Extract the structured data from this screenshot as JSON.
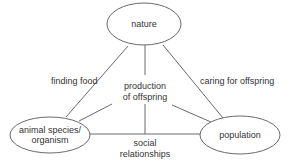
{
  "diagram": {
    "type": "concept-triangle",
    "nodes": [
      {
        "id": "nature",
        "lines": [
          "nature"
        ]
      },
      {
        "id": "animal",
        "lines": [
          "animal species/",
          "organism"
        ]
      },
      {
        "id": "population",
        "lines": [
          "population"
        ]
      }
    ],
    "edges": [
      {
        "from": "nature",
        "to": "animal",
        "label": "finding food"
      },
      {
        "from": "nature",
        "to": "population",
        "label": "caring for offspring"
      },
      {
        "from": "animal",
        "to": "population",
        "label_lines": [
          "social",
          "relationships"
        ]
      },
      {
        "from": "center",
        "to": "all",
        "label_lines": [
          "production",
          "of offspring"
        ]
      }
    ]
  },
  "labels": {
    "nature": "nature",
    "animal_1": "animal species/",
    "animal_2": "organism",
    "population": "population",
    "finding_food": "finding food",
    "caring": "caring for offspring",
    "production_1": "production",
    "production_2": "of offspring",
    "social_1": "social",
    "social_2": "relationships"
  },
  "colors": {
    "stroke": "#6a6a6a",
    "text": "#333333",
    "background": "#ffffff"
  }
}
